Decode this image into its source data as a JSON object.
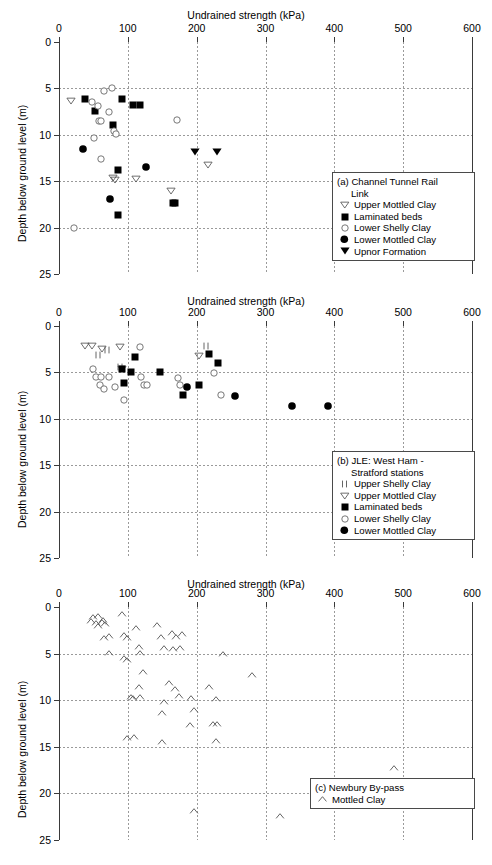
{
  "figure": {
    "axis_x_title": "Undrained strength (kPa)",
    "axis_y_title": "Depth below ground level (m)",
    "x_ticks": [
      "0",
      "100",
      "200",
      "300",
      "400",
      "500",
      "600"
    ],
    "y_ticks": [
      "0",
      "5",
      "10",
      "15",
      "20",
      "25"
    ],
    "colors": {
      "marker": "#000000",
      "open_marker": "#555555",
      "grid": "#9a9a9a",
      "axis": "#3a3a3a"
    }
  },
  "panels": [
    {
      "id": "a",
      "legend": {
        "title_line1": "(a) Channel Tunnel Rail",
        "title_line2": "Link",
        "entries": [
          {
            "symbol": "open-down-triangle",
            "label": "Upper Mottled Clay"
          },
          {
            "symbol": "filled-square",
            "label": "Laminated beds"
          },
          {
            "symbol": "open-circle",
            "label": "Lower Shelly Clay"
          },
          {
            "symbol": "filled-circle",
            "label": "Lower Mottled Clay"
          },
          {
            "symbol": "filled-down-triangle",
            "label": "Upnor Formation"
          }
        ]
      },
      "chart_data": {
        "type": "scatter",
        "title": "(a) Channel Tunnel Rail Link",
        "xlabel": "Undrained strength (kPa)",
        "ylabel": "Depth below ground level (m)",
        "xlim": [
          0,
          600
        ],
        "ylim": [
          0,
          25
        ],
        "y_inverted": true,
        "grid": true,
        "legend_position": "lower-right",
        "series": [
          {
            "name": "Upper Mottled Clay",
            "symbol": "open-down-triangle",
            "points": [
              [
                17,
                6.4
              ],
              [
                79,
                14.6
              ],
              [
                81,
                14.9
              ],
              [
                112,
                14.8
              ],
              [
                163,
                16.1
              ],
              [
                216,
                13.3
              ]
            ]
          },
          {
            "name": "Laminated beds",
            "symbol": "filled-square",
            "points": [
              [
                38,
                6.1
              ],
              [
                52,
                7.4
              ],
              [
                79,
                8.9
              ],
              [
                92,
                6.1
              ],
              [
                108,
                6.8
              ],
              [
                117,
                6.8
              ],
              [
                85,
                13.8
              ],
              [
                86,
                18.6
              ],
              [
                166,
                17.3
              ],
              [
                169,
                17.3
              ]
            ]
          },
          {
            "name": "Lower Shelly Clay",
            "symbol": "open-circle",
            "points": [
              [
                48,
                6.5
              ],
              [
                57,
                6.9
              ],
              [
                66,
                5.3
              ],
              [
                73,
                7.5
              ],
              [
                77,
                5.0
              ],
              [
                58,
                8.5
              ],
              [
                61,
                8.5
              ],
              [
                80,
                9.6
              ],
              [
                51,
                10.3
              ],
              [
                61,
                12.6
              ],
              [
                83,
                9.9
              ],
              [
                21,
                20.0
              ],
              [
                172,
                8.4
              ]
            ]
          },
          {
            "name": "Lower Mottled Clay",
            "symbol": "filled-circle",
            "points": [
              [
                35,
                11.5
              ],
              [
                74,
                16.9
              ],
              [
                126,
                13.5
              ]
            ]
          },
          {
            "name": "Upnor Formation",
            "symbol": "filled-down-triangle",
            "points": [
              [
                198,
                11.9
              ],
              [
                229,
                11.9
              ]
            ]
          }
        ]
      }
    },
    {
      "id": "b",
      "legend": {
        "title_line1": "(b)  JLE: West Ham -",
        "title_line2": "Stratford stations",
        "entries": [
          {
            "symbol": "double-bar",
            "label": "Upper Shelly Clay"
          },
          {
            "symbol": "open-down-triangle",
            "label": "Upper Mottled Clay"
          },
          {
            "symbol": "filled-square",
            "label": "Laminated beds"
          },
          {
            "symbol": "open-circle",
            "label": "Lower Shelly Clay"
          },
          {
            "symbol": "filled-circle",
            "label": "Lower Mottled Clay"
          }
        ]
      },
      "chart_data": {
        "type": "scatter",
        "title": "(b) JLE: West Ham - Stratford stations",
        "xlabel": "Undrained strength (kPa)",
        "ylabel": "Depth below ground level (m)",
        "xlim": [
          0,
          600
        ],
        "ylim": [
          0,
          25
        ],
        "y_inverted": true,
        "grid": true,
        "legend_position": "lower-right",
        "series": [
          {
            "name": "Upper Shelly Clay",
            "symbol": "double-bar",
            "points": [
              [
                56,
                3.1
              ],
              [
                70,
                2.6
              ],
              [
                89,
                4.4
              ],
              [
                214,
                2.2
              ]
            ]
          },
          {
            "name": "Upper Mottled Clay",
            "symbol": "open-down-triangle",
            "points": [
              [
                37,
                2.2
              ],
              [
                48,
                2.2
              ],
              [
                63,
                2.5
              ],
              [
                89,
                2.3
              ],
              [
                91,
                4.6
              ],
              [
                204,
                3.2
              ]
            ]
          },
          {
            "name": "Laminated beds",
            "symbol": "filled-square",
            "points": [
              [
                92,
                4.6
              ],
              [
                95,
                6.1
              ],
              [
                105,
                5.0
              ],
              [
                111,
                3.3
              ],
              [
                146,
                5.0
              ],
              [
                180,
                7.4
              ],
              [
                203,
                6.4
              ],
              [
                218,
                3.0
              ],
              [
                231,
                4.0
              ]
            ]
          },
          {
            "name": "Lower Shelly Clay",
            "symbol": "open-circle",
            "points": [
              [
                50,
                4.6
              ],
              [
                54,
                5.5
              ],
              [
                61,
                5.5
              ],
              [
                59,
                6.4
              ],
              [
                66,
                6.8
              ],
              [
                72,
                5.5
              ],
              [
                81,
                6.6
              ],
              [
                95,
                8.0
              ],
              [
                118,
                2.3
              ],
              [
                119,
                5.5
              ],
              [
                124,
                6.3
              ],
              [
                128,
                6.3
              ],
              [
                173,
                5.6
              ],
              [
                176,
                6.4
              ],
              [
                225,
                5.1
              ],
              [
                235,
                7.4
              ]
            ]
          },
          {
            "name": "Lower Mottled Clay",
            "symbol": "filled-circle",
            "points": [
              [
                186,
                6.6
              ],
              [
                256,
                7.5
              ],
              [
                339,
                8.6
              ],
              [
                391,
                8.6
              ]
            ]
          }
        ]
      }
    },
    {
      "id": "c",
      "legend": {
        "title_line1": "(c)  Newbury By-pass",
        "title_line2": "",
        "entries": [
          {
            "symbol": "open-up-chevron",
            "label": "Mottled Clay"
          }
        ]
      },
      "chart_data": {
        "type": "scatter",
        "title": "(c) Newbury By-pass",
        "xlabel": "Undrained strength (kPa)",
        "ylabel": "Depth below ground level (m)",
        "xlim": [
          0,
          600
        ],
        "ylim": [
          0,
          25
        ],
        "y_inverted": true,
        "grid": true,
        "legend_position": "bottom-right",
        "series": [
          {
            "name": "Mottled Clay",
            "symbol": "open-up-chevron",
            "points": [
              [
                46,
                1.5
              ],
              [
                50,
                1.1
              ],
              [
                53,
                1.7
              ],
              [
                56,
                1.0
              ],
              [
                57,
                2.0
              ],
              [
                62,
                1.6
              ],
              [
                64,
                1.4
              ],
              [
                67,
                1.8
              ],
              [
                66,
                3.3
              ],
              [
                72,
                3.1
              ],
              [
                72,
                4.9
              ],
              [
                92,
                0.7
              ],
              [
                94,
                3.0
              ],
              [
                95,
                5.5
              ],
              [
                98,
                3.3
              ],
              [
                99,
                5.7
              ],
              [
                112,
                2.3
              ],
              [
                116,
                4.3
              ],
              [
                118,
                4.9
              ],
              [
                122,
                7.0
              ],
              [
                116,
                8.6
              ],
              [
                105,
                9.6
              ],
              [
                107,
                9.8
              ],
              [
                118,
                9.6
              ],
              [
                142,
                1.9
              ],
              [
                148,
                3.2
              ],
              [
                152,
                4.4
              ],
              [
                164,
                2.8
              ],
              [
                166,
                4.5
              ],
              [
                170,
                3.2
              ],
              [
                178,
                2.9
              ],
              [
                176,
                4.4
              ],
              [
                160,
                8.2
              ],
              [
                168,
                8.8
              ],
              [
                174,
                9.5
              ],
              [
                152,
                10.2
              ],
              [
                150,
                11.4
              ],
              [
                192,
                9.8
              ],
              [
                196,
                11.0
              ],
              [
                190,
                12.7
              ],
              [
                99,
                14.0
              ],
              [
                109,
                13.9
              ],
              [
                149,
                14.5
              ],
              [
                218,
                8.6
              ],
              [
                228,
                9.9
              ],
              [
                224,
                12.6
              ],
              [
                230,
                12.6
              ],
              [
                228,
                14.4
              ],
              [
                238,
                5.0
              ],
              [
                281,
                7.3
              ],
              [
                486,
                17.3
              ],
              [
                196,
                21.9
              ],
              [
                321,
                22.4
              ]
            ]
          }
        ]
      }
    }
  ]
}
